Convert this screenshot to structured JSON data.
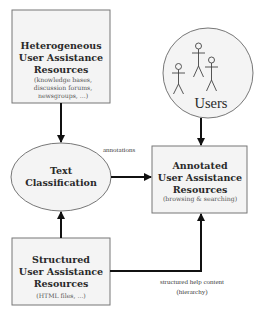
{
  "diagram": {
    "type": "flow",
    "colors": {
      "node_fill": "#f4f4f4",
      "node_stroke": "#777777",
      "edge": "#111111",
      "text": "#2a2a2a"
    },
    "nodes": {
      "heterogeneous": {
        "title_lines": [
          "Heterogeneous",
          "User Assistance",
          "Resources"
        ],
        "sub_lines": [
          "(knowledge bases,",
          "discussion forums,",
          "newsgroups, ...)"
        ]
      },
      "users": {
        "label": "Users",
        "icon": "stick-figures-icon",
        "figure_count": 3
      },
      "classification": {
        "title_lines": [
          "Text",
          "Classification"
        ]
      },
      "annotated": {
        "title_lines": [
          "Annotated",
          "User Assistance",
          "Resources"
        ],
        "sub_lines": [
          "(browsing & searching)"
        ]
      },
      "structured": {
        "title_lines": [
          "Structured",
          "User Assistance",
          "Resources"
        ],
        "sub_lines": [
          "(HTML files, ...)"
        ]
      }
    },
    "edges": [
      {
        "from": "heterogeneous",
        "to": "classification",
        "label": ""
      },
      {
        "from": "users",
        "to": "annotated",
        "label": ""
      },
      {
        "from": "classification",
        "to": "annotated",
        "label": "annotations"
      },
      {
        "from": "structured",
        "to": "classification",
        "label": ""
      },
      {
        "from": "structured",
        "to": "annotated",
        "label_lines": [
          "structured help content",
          "(hierarchy)"
        ]
      }
    ]
  }
}
